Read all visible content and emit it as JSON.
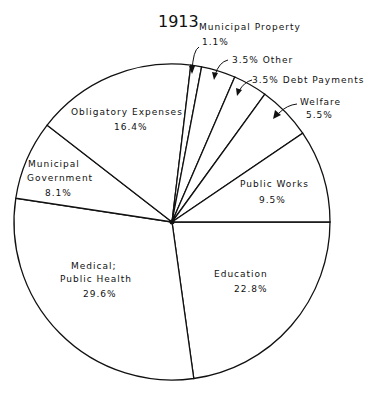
{
  "chart_data": {
    "type": "pie",
    "title": "1913",
    "unit": "%",
    "slices": [
      {
        "label": "Education",
        "value": 22.8
      },
      {
        "label": "Medical; Public Health",
        "value": 29.6
      },
      {
        "label": "Municipal Government",
        "value": 8.1
      },
      {
        "label": "Obligatory Expenses",
        "value": 16.4
      },
      {
        "label": "Municipal Property",
        "value": 1.1
      },
      {
        "label": "Other",
        "value": 3.5
      },
      {
        "label": "Debt Payments",
        "value": 3.5
      },
      {
        "label": "Welfare",
        "value": 5.5
      },
      {
        "label": "Public Works",
        "value": 9.5
      }
    ],
    "start_angle_deg": 0,
    "direction": "clockwise",
    "colors": {
      "fill": "#ffffff",
      "stroke": "#111111"
    }
  },
  "labels": {
    "title": "1913",
    "education_name": "Education",
    "education_pct": "22.8%",
    "medical_name_1": "Medical;",
    "medical_name_2": "Public Health",
    "medical_pct": "29.6%",
    "municipal_gov_name_1": "Municipal",
    "municipal_gov_name_2": "Government",
    "municipal_gov_pct": "8.1%",
    "obligatory_name": "Obligatory Expenses",
    "obligatory_pct": "16.4%",
    "municipal_property_name": "Municipal Property",
    "municipal_property_pct": "1.1%",
    "other_text": "3.5%  Other",
    "debt_text": "3.5%  Debt Payments",
    "welfare_name": "Welfare",
    "welfare_pct": "5.5%",
    "public_works_name": "Public Works",
    "public_works_pct": "9.5%"
  }
}
